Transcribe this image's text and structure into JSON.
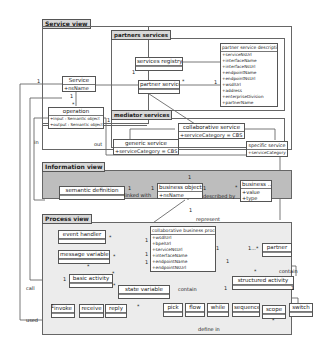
{
  "packages": {
    "service_view": "Service view",
    "partners_services": "partners services",
    "mediator_services": "mediator services",
    "information_view": "Information view",
    "process_view": "Process view"
  },
  "classes": {
    "service": {
      "name": "Service",
      "attrs": [
        "+nsName"
      ]
    },
    "operation": {
      "name": "operation",
      "attrs": [
        "+input : Semantic object",
        "+output : Semantic object"
      ]
    },
    "services_registry": {
      "name": "services registry"
    },
    "partner_service": {
      "name": "partner service"
    },
    "partner_service_description": {
      "name": "partner service description",
      "attrs": [
        "+serviceNsUrl",
        "+interfaceName",
        "+interfaceNsUrl",
        "+endpointName",
        "+endpointNsUrl",
        "+wsdlUrl",
        "+address",
        "+enterpriseDivision",
        "+partnerName"
      ]
    },
    "collaborative_service": {
      "name": "collaborative service",
      "attrs": [
        "+serviceCategory = CBS"
      ]
    },
    "generic_service": {
      "name": "generic service",
      "attrs": [
        "+serviceCategory = CBS"
      ]
    },
    "specific_service": {
      "name": "specific service",
      "attrs": [
        "+serviceCategory = CBS"
      ]
    },
    "semantic_definition": {
      "name": "semantic definition"
    },
    "business_object": {
      "name": "business object",
      "attrs": [
        "+nsName"
      ]
    },
    "business_attr": {
      "name": "business ...",
      "attrs": [
        "+value",
        "+type"
      ]
    },
    "event_handler": {
      "name": "event handler"
    },
    "message_variable": {
      "name": "message variable"
    },
    "collaborative_business_process": {
      "name": "collaborative business process",
      "attrs": [
        "+wsdlUrl",
        "+bpelUrl",
        "+serviceNsUrl",
        "+interfaceName",
        "+endpointName",
        "+endpointNsUrl"
      ]
    },
    "partner": {
      "name": "partner"
    },
    "basic_activity": {
      "name": "basic activity"
    },
    "state_variable": {
      "name": "state variable"
    },
    "structured_activity": {
      "name": "structured activity"
    },
    "invoke": {
      "name": "invoke"
    },
    "receive": {
      "name": "receive"
    },
    "reply": {
      "name": "reply"
    },
    "pick": {
      "name": "pick"
    },
    "flow": {
      "name": "flow"
    },
    "while": {
      "name": "while"
    },
    "sequence": {
      "name": "sequence"
    },
    "scope": {
      "name": "scope"
    },
    "switch": {
      "name": "switch"
    }
  },
  "labels": {
    "in": "in",
    "out": "out",
    "linked_with": "linked with",
    "described_by": "described by",
    "represent": "represent",
    "call": "call",
    "used": "used",
    "contain_1": "contain",
    "contain_2": "contain",
    "define_in": "define in",
    "one": "1",
    "star": "*",
    "one_to_many": "1...*"
  }
}
